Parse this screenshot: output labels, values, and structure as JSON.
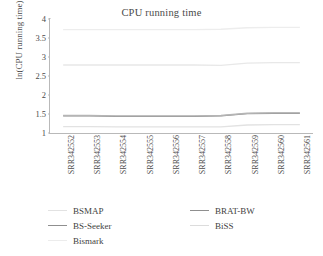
{
  "chart_data": {
    "type": "line",
    "title": "CPU running time",
    "xlabel": "",
    "ylabel": "ln(CPU running time)",
    "ylim": [
      1,
      4
    ],
    "yticks": [
      "4",
      "3.5",
      "3",
      "2.5",
      "2",
      "1.5",
      "1"
    ],
    "grid": false,
    "legend_position": "bottom",
    "categories": [
      "SRR342552",
      "SRR342553",
      "SRR342554",
      "SRR342555",
      "SRR342556",
      "SRR342557",
      "SRR342558",
      "SRR342559",
      "SRR342560",
      "SRR342561"
    ],
    "series": [
      {
        "name": "BSMAP",
        "color": "#e2e2e2",
        "values": [
          1.17,
          1.17,
          1.16,
          1.16,
          1.16,
          1.16,
          1.16,
          1.21,
          1.22,
          1.22
        ]
      },
      {
        "name": "BS-Seeker",
        "color": "#8f8f8f",
        "values": [
          1.45,
          1.45,
          1.44,
          1.44,
          1.44,
          1.44,
          1.45,
          1.51,
          1.52,
          1.52
        ]
      },
      {
        "name": "Bismark",
        "color": "#ededed",
        "values": [
          3.72,
          3.72,
          3.72,
          3.72,
          3.72,
          3.72,
          3.73,
          3.77,
          3.78,
          3.78
        ]
      },
      {
        "name": "BRAT-BW",
        "color": "#b5b5b5",
        "values": [
          1.46,
          1.46,
          1.45,
          1.45,
          1.45,
          1.45,
          1.46,
          1.52,
          1.53,
          1.53
        ]
      },
      {
        "name": "BiSS",
        "color": "#e8e8e8",
        "values": [
          2.79,
          2.79,
          2.79,
          2.79,
          2.79,
          2.79,
          2.78,
          2.84,
          2.85,
          2.85
        ]
      }
    ]
  },
  "legend": {
    "items": [
      {
        "label": "BSMAP",
        "color": "#e2e2e2"
      },
      {
        "label": "BRAT-BW",
        "color": "#8f8f8f"
      },
      {
        "label": "BS-Seeker",
        "color": "#8f8f8f"
      },
      {
        "label": "BiSS",
        "color": "#dcdcdc"
      },
      {
        "label": "Bismark",
        "color": "#ececec"
      }
    ]
  },
  "axis": {
    "y_label": "ln(CPU running time)"
  }
}
